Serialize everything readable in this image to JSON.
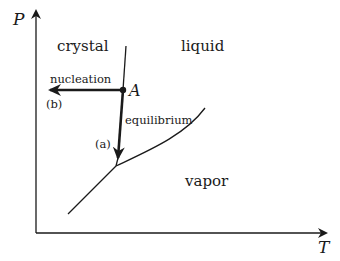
{
  "diagram": {
    "axes": {
      "y_label": "P",
      "x_label": "T"
    },
    "regions": {
      "crystal": "crystal",
      "liquid": "liquid",
      "vapor": "vapor"
    },
    "point": {
      "label": "A"
    },
    "annotations": {
      "nucleation": "nucleation",
      "path_b": "(b)",
      "path_a": "(a)",
      "equilibrium": "equilibrium"
    },
    "colors": {
      "ink": "#1a1a1a",
      "background": "#ffffff"
    }
  }
}
